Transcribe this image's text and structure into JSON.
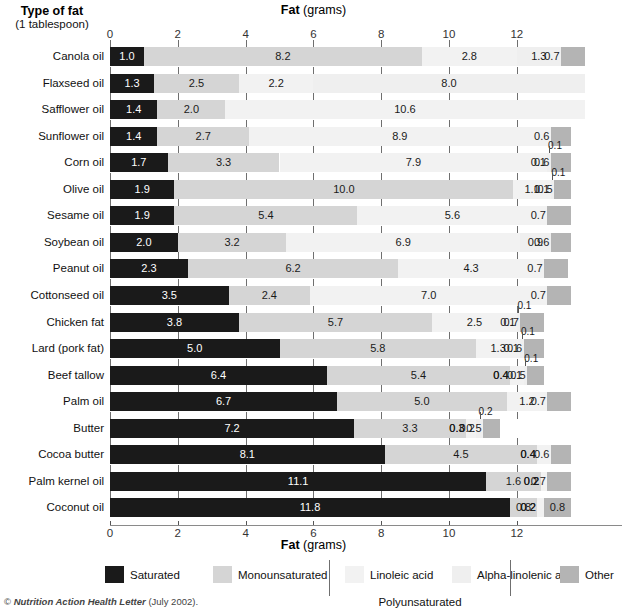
{
  "header": {
    "corner_title_line1": "Type of fat",
    "corner_title_line2": "(1 tablespoon)",
    "axis_title_bold": "Fat",
    "axis_title_rest": " (grams)"
  },
  "footer": {
    "copyright_symbol": "©",
    "source_italic": "Nutrition Action Health Letter",
    "source_rest": " (July 2002)."
  },
  "legend": {
    "items": [
      {
        "label": "Saturated",
        "color": "#1a1a1a"
      },
      {
        "label": "Monounsaturated",
        "color": "#d5d5d5"
      },
      {
        "label": "Linoleic acid",
        "color": "#f2f2f2"
      },
      {
        "label": "Alpha-linolenic acid",
        "color": "#efefef"
      },
      {
        "label": "Other",
        "color": "#b4b4b4"
      }
    ],
    "group_label": "Polyunsaturated"
  },
  "chart_data": {
    "type": "bar",
    "orientation": "horizontal",
    "stacked": true,
    "title": "Fat (grams)",
    "xlabel": "Fat (grams)",
    "ylabel": "Type of fat (1 tablespoon)",
    "xlim": [
      0,
      15
    ],
    "xticks": [
      0,
      2,
      4,
      6,
      8,
      10,
      12
    ],
    "grid": true,
    "legend_position": "bottom",
    "series_names": [
      "Saturated",
      "Monounsaturated",
      "Linoleic acid",
      "Alpha-linolenic acid",
      "Other"
    ],
    "categories": [
      "Canola oil",
      "Flaxseed oil",
      "Safflower oil",
      "Sunflower oil",
      "Corn oil",
      "Olive oil",
      "Sesame oil",
      "Soybean oil",
      "Peanut oil",
      "Cottonseed oil",
      "Chicken fat",
      "Lard (pork fat)",
      "Beef tallow",
      "Palm oil",
      "Butter",
      "Cocoa butter",
      "Palm kernel oil",
      "Coconut oil"
    ],
    "series": [
      {
        "name": "Saturated",
        "values": [
          1.0,
          1.3,
          1.4,
          1.4,
          1.7,
          1.9,
          1.9,
          2.0,
          2.3,
          3.5,
          3.8,
          5.0,
          6.4,
          6.7,
          7.2,
          8.1,
          11.1,
          11.8
        ]
      },
      {
        "name": "Monounsaturated",
        "values": [
          8.2,
          2.5,
          2.0,
          2.7,
          3.3,
          10.0,
          5.4,
          3.2,
          6.2,
          2.4,
          5.7,
          5.8,
          5.4,
          5.0,
          3.3,
          4.5,
          1.6,
          0.8
        ]
      },
      {
        "name": "Linoleic acid",
        "values": [
          2.8,
          2.2,
          10.6,
          8.9,
          7.9,
          1.1,
          5.6,
          6.9,
          4.3,
          7.0,
          2.5,
          1.3,
          0.4,
          1.2,
          0.3,
          0.4,
          0.2,
          0.2
        ]
      },
      {
        "name": "Alpha-linolenic acid",
        "values": [
          1.3,
          8.0,
          0.0,
          0.0,
          0.1,
          0.1,
          0.0,
          0.9,
          0.0,
          0.0,
          0.1,
          0.1,
          0.1,
          0.0,
          0.2,
          0.0,
          0.0,
          0.0
        ]
      },
      {
        "name": "Other",
        "values": [
          0.7,
          0.0,
          0.0,
          0.6,
          0.6,
          0.5,
          0.7,
          0.6,
          0.7,
          0.7,
          0.7,
          0.6,
          0.5,
          0.7,
          0.5,
          0.6,
          0.7,
          0.8
        ]
      }
    ]
  }
}
